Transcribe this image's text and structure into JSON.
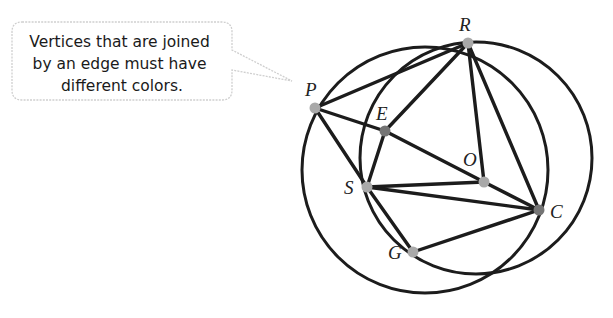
{
  "callout": {
    "lines": [
      "Vertices that are joined",
      "by an edge must have",
      "different colors."
    ],
    "border_color": "#cfcfcf"
  },
  "colors": {
    "edge": "#1c1c1c",
    "vertex_light": "#a9a9a9",
    "vertex_dark": "#747474"
  },
  "vertices": [
    {
      "id": "P",
      "label": "P",
      "x": 315,
      "y": 108,
      "shade": "light",
      "lx": 305,
      "ly": 96
    },
    {
      "id": "R",
      "label": "R",
      "x": 468,
      "y": 43,
      "shade": "light",
      "lx": 459,
      "ly": 31
    },
    {
      "id": "E",
      "label": "E",
      "x": 385,
      "y": 131,
      "shade": "dark",
      "lx": 376,
      "ly": 120
    },
    {
      "id": "O",
      "label": "O",
      "x": 484,
      "y": 182,
      "shade": "light",
      "lx": 463,
      "ly": 166
    },
    {
      "id": "S",
      "label": "S",
      "x": 367,
      "y": 187,
      "shade": "light",
      "lx": 344,
      "ly": 194
    },
    {
      "id": "C",
      "label": "C",
      "x": 539,
      "y": 210,
      "shade": "dark",
      "lx": 550,
      "ly": 218
    },
    {
      "id": "G",
      "label": "G",
      "x": 413,
      "y": 252,
      "shade": "light",
      "lx": 388,
      "ly": 259
    }
  ],
  "edges": [
    [
      "P",
      "R"
    ],
    [
      "P",
      "E"
    ],
    [
      "P",
      "S"
    ],
    [
      "E",
      "R"
    ],
    [
      "E",
      "S"
    ],
    [
      "E",
      "O"
    ],
    [
      "R",
      "O"
    ],
    [
      "R",
      "C"
    ],
    [
      "S",
      "O"
    ],
    [
      "S",
      "C"
    ],
    [
      "S",
      "G"
    ],
    [
      "G",
      "C"
    ],
    [
      "O",
      "C"
    ]
  ],
  "circles": [
    {
      "name": "left-circle",
      "cx": 425,
      "cy": 170,
      "r": 123
    },
    {
      "name": "right-circle",
      "cx": 476,
      "cy": 158,
      "r": 116
    }
  ]
}
